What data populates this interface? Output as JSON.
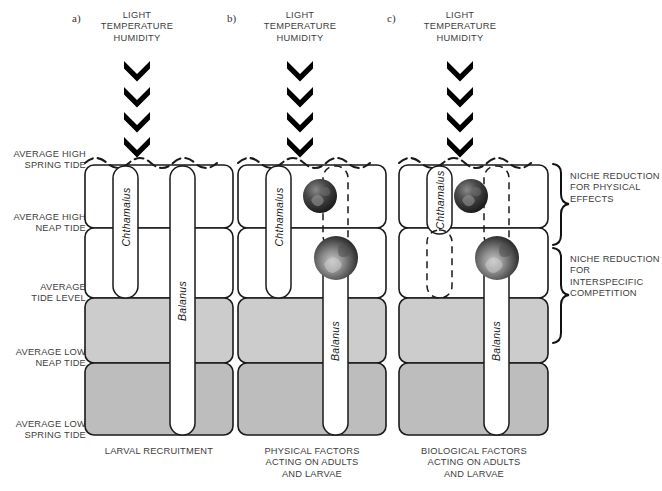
{
  "figure": {
    "colors": {
      "zone_light": "#ffffff",
      "zone_mid_gray": "#cccccc",
      "zone_dark_gray": "#bdbdbd",
      "outline": "#1a1a1a",
      "text": "#3d3d3d",
      "barnacle_dark": "#2b2b2b"
    }
  },
  "panels": [
    {
      "letter": "a)",
      "stressors": [
        "LIGHT",
        "TEMPERATURE",
        "HUMIDITY"
      ],
      "caption": "LARVAL RECRUITMENT",
      "species": [
        {
          "name": "Chthamalus",
          "style": "solid"
        },
        {
          "name": "Balanus",
          "style": "solid"
        }
      ]
    },
    {
      "letter": "b)",
      "stressors": [
        "LIGHT",
        "TEMPERATURE",
        "HUMIDITY"
      ],
      "caption": "PHYSICAL FACTORS\nACTING ON ADULTS\nAND LARVAE",
      "caption_lines": [
        "PHYSICAL FACTORS",
        "ACTING ON ADULTS",
        "AND LARVAE"
      ],
      "species": [
        {
          "name": "Chthamalus",
          "style": "solid"
        },
        {
          "name": "Balanus",
          "style": "dashed-above"
        }
      ]
    },
    {
      "letter": "c)",
      "stressors": [
        "LIGHT",
        "TEMPERATURE",
        "HUMIDITY"
      ],
      "caption": "BIOLOGICAL FACTORS\nACTING ON ADULTS\nAND LARVAE",
      "caption_lines": [
        "BIOLOGICAL FACTORS",
        "ACTING ON ADULTS",
        "AND LARVAE"
      ],
      "species": [
        {
          "name": "Chthamalus",
          "style": "dashed-below"
        },
        {
          "name": "Balanus",
          "style": "dashed-above"
        }
      ]
    }
  ],
  "tide_levels": [
    {
      "lines": [
        "AVERAGE HIGH",
        "SPRING TIDE"
      ]
    },
    {
      "lines": [
        "AVERAGE HIGH",
        "NEAP TIDE"
      ]
    },
    {
      "lines": [
        "AVERAGE",
        "TIDE LEVEL"
      ]
    },
    {
      "lines": [
        "AVERAGE LOW",
        "NEAP TIDE"
      ]
    },
    {
      "lines": [
        "AVERAGE LOW",
        "SPRING TIDE"
      ]
    }
  ],
  "braces": [
    {
      "lines": [
        "NICHE REDUCTION",
        "FOR PHYSICAL",
        "EFFECTS"
      ]
    },
    {
      "lines": [
        "NICHE REDUCTION",
        "FOR INTERSPECIFIC",
        "COMPETITION"
      ]
    }
  ],
  "chevron_count": 4
}
